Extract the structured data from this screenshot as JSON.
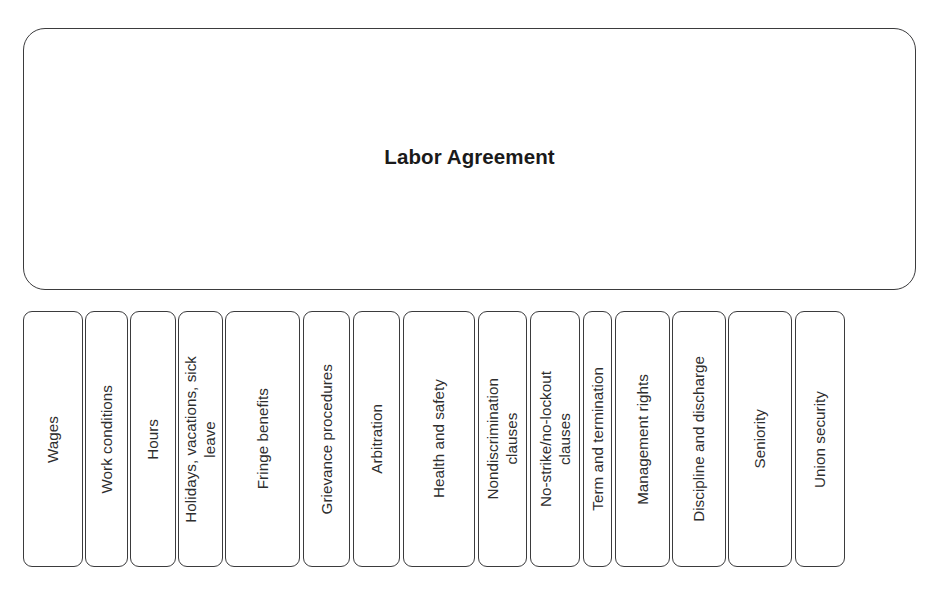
{
  "diagram": {
    "type": "hierarchy-tree",
    "background_color": "#ffffff",
    "line_color": "#3b3b3d",
    "text_color": "#2e2e2e",
    "parent": {
      "title": "Labor Agreement",
      "shape": "rounded-rectangle"
    },
    "children": [
      {
        "label": "Wages",
        "left": 23,
        "width": 60
      },
      {
        "label": "Work conditions",
        "left": 85,
        "width": 43
      },
      {
        "label": "Hours",
        "left": 130,
        "width": 46
      },
      {
        "label": "Holidays, vacations, sick\nleave",
        "left": 178,
        "width": 45
      },
      {
        "label": "Fringe benefits",
        "left": 225,
        "width": 75
      },
      {
        "label": "Grievance procedures",
        "left": 303,
        "width": 47
      },
      {
        "label": "Arbitration",
        "left": 353,
        "width": 47
      },
      {
        "label": "Health and safety",
        "left": 403,
        "width": 72
      },
      {
        "label": "Nondiscrimination\nclauses",
        "left": 478,
        "width": 49
      },
      {
        "label": "No-strike/no-lockout\nclauses",
        "left": 530,
        "width": 50
      },
      {
        "label": "Term and termination",
        "left": 583,
        "width": 29
      },
      {
        "label": "Management rights",
        "left": 615,
        "width": 55
      },
      {
        "label": "Discipline and discharge",
        "left": 672,
        "width": 54
      },
      {
        "label": "Seniority",
        "left": 728,
        "width": 64
      },
      {
        "label": "Union security",
        "left": 795,
        "width": 50
      }
    ]
  }
}
